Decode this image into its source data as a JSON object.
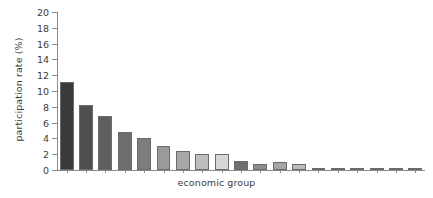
{
  "chart_data": {
    "type": "bar",
    "title": "",
    "xlabel": "economic group",
    "ylabel": "participation rate (%)",
    "ylim": [
      0,
      20
    ],
    "ytick_values": [
      0,
      2,
      4,
      6,
      8,
      10,
      12,
      14,
      16,
      18,
      20
    ],
    "ytick_labels": [
      "0",
      "2",
      "4",
      "6",
      "8",
      "10",
      "12",
      "14",
      "16",
      "18",
      "20"
    ],
    "xtick_labels": [],
    "grid": false,
    "legend": null,
    "categories": [
      "1",
      "2",
      "3",
      "4",
      "5",
      "6",
      "7",
      "8",
      "9",
      "10",
      "11",
      "12",
      "13",
      "14",
      "15",
      "16",
      "17",
      "18",
      "19"
    ],
    "values": [
      11.1,
      8.2,
      6.8,
      4.8,
      4.0,
      3.0,
      2.4,
      2.0,
      2.0,
      1.2,
      0.7,
      1.0,
      0.7,
      0.25,
      0.2,
      0.2,
      0.2,
      0.15,
      0.15
    ],
    "bar_colors": [
      "#3a3a3a",
      "#4f4f4f",
      "#5e5e5e",
      "#6e6e6e",
      "#7d7d7d",
      "#9a9a9a",
      "#a8a8a8",
      "#bdbdbd",
      "#d6d6d6",
      "#707070",
      "#8d8d8d",
      "#a5a5a5",
      "#bcbcbc",
      "#c9c9c9",
      "#9f9f9f",
      "#8f8f8f",
      "#8f8f8f",
      "#9a9a9a",
      "#a5a5a5"
    ],
    "bar_edge_color": "#6b6b6b",
    "axis_color": "#8a8a8a",
    "text_color": "#3b3b3b",
    "background": "#ffffff"
  }
}
